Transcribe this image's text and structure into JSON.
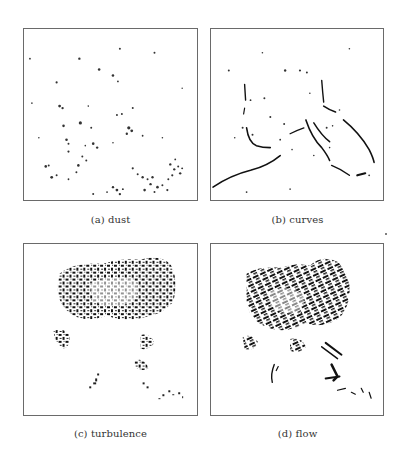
{
  "figure": {
    "panels": [
      {
        "id": "a",
        "label": "(a) dust",
        "content": "sparse scattered dots"
      },
      {
        "id": "b",
        "label": "(b) curves",
        "content": "thin curved strokes"
      },
      {
        "id": "c",
        "label": "(c) turbulence",
        "content": "dense noisy blotches"
      },
      {
        "id": "d",
        "label": "(d) flow",
        "content": "dense directional strokes"
      }
    ]
  }
}
